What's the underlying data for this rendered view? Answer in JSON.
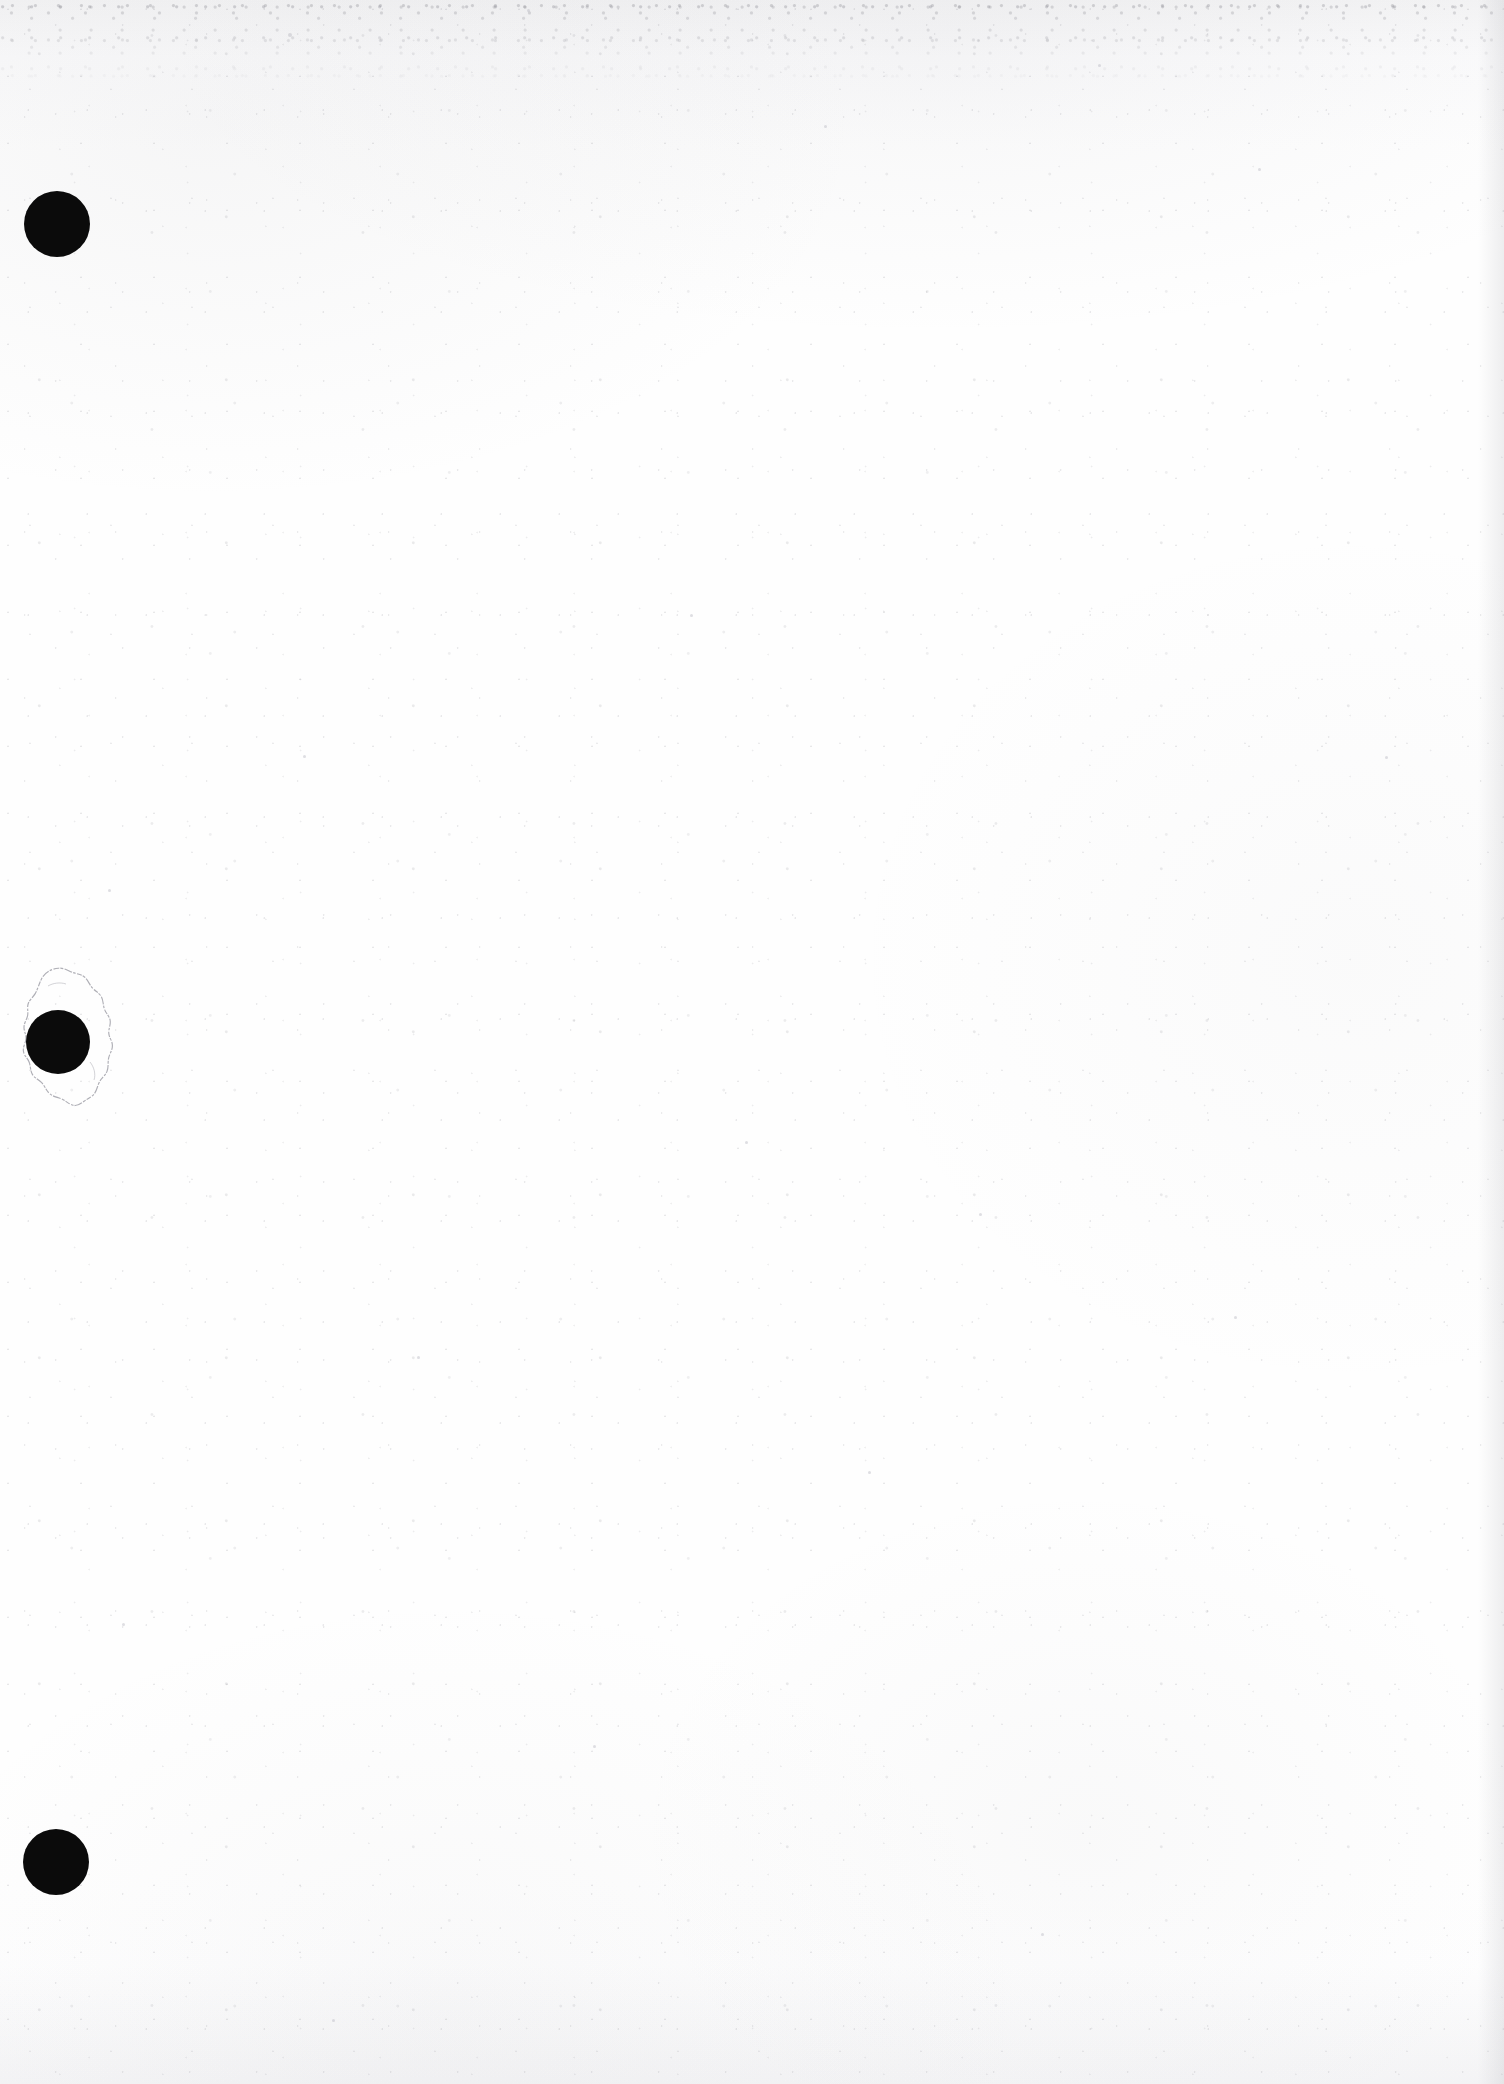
{
  "document": {
    "kind": "scanned-document-page",
    "page_content": "",
    "visible_text": "",
    "background_color": "#fefefe",
    "ink_color": "#0b0b0b",
    "grain_color": "#bcbcc2",
    "width": 1504,
    "height": 2084
  },
  "margin": {
    "label": "left-binding-margin",
    "hole_count": 3
  },
  "holes": [
    {
      "name": "punch-hole-top",
      "order": "1",
      "cx": 57,
      "cy": 224,
      "r": 33,
      "color": "#0b0b0b",
      "damaged": "false"
    },
    {
      "name": "punch-hole-middle",
      "order": "2",
      "cx": 58,
      "cy": 1042,
      "r": 32,
      "color": "#0b0b0b",
      "damaged": "true",
      "tear": {
        "name": "torn-paper-outline",
        "left": 20,
        "top": 966,
        "width": 96,
        "height": 148,
        "stroke_color": "#9a9aa2"
      }
    },
    {
      "name": "punch-hole-bottom",
      "order": "3",
      "cx": 56,
      "cy": 1862,
      "r": 33,
      "color": "#0b0b0b",
      "damaged": "false"
    }
  ],
  "artifacts": {
    "top_edge_band": "#eeeeef",
    "right_edge_band": "#f0f0f2",
    "specks": [
      {
        "x": 288,
        "y": 33,
        "d": 4
      },
      {
        "x": 527,
        "y": 9,
        "d": 3
      },
      {
        "x": 824,
        "y": 125,
        "d": 3
      },
      {
        "x": 1098,
        "y": 64,
        "d": 3
      },
      {
        "x": 1258,
        "y": 168,
        "d": 3
      },
      {
        "x": 108,
        "y": 889,
        "d": 3
      },
      {
        "x": 303,
        "y": 755,
        "d": 3
      },
      {
        "x": 690,
        "y": 614,
        "d": 3
      },
      {
        "x": 1385,
        "y": 756,
        "d": 3
      },
      {
        "x": 745,
        "y": 1141,
        "d": 3
      },
      {
        "x": 979,
        "y": 1213,
        "d": 3
      },
      {
        "x": 417,
        "y": 1356,
        "d": 3
      },
      {
        "x": 1234,
        "y": 1316,
        "d": 3
      },
      {
        "x": 868,
        "y": 1471,
        "d": 3
      },
      {
        "x": 122,
        "y": 1623,
        "d": 3
      },
      {
        "x": 593,
        "y": 1745,
        "d": 3
      },
      {
        "x": 1041,
        "y": 1933,
        "d": 3
      },
      {
        "x": 332,
        "y": 2019,
        "d": 3
      }
    ]
  }
}
